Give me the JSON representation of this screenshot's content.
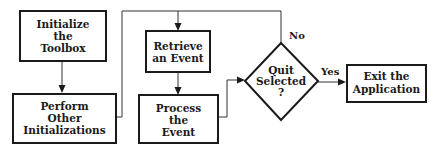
{
  "diagram": {
    "type": "flowchart",
    "nodes": {
      "init_toolbox": {
        "lines": [
          "Initialize",
          "the",
          "Toolbox"
        ],
        "shape": "rectangle"
      },
      "other_inits": {
        "lines": [
          "Perform",
          "Other",
          "Initializations"
        ],
        "shape": "rectangle"
      },
      "retrieve_event": {
        "lines": [
          "Retrieve",
          "an Event"
        ],
        "shape": "rectangle"
      },
      "process_event": {
        "lines": [
          "Process",
          "the",
          "Event"
        ],
        "shape": "rectangle"
      },
      "quit_selected": {
        "lines": [
          "Quit",
          "Selected",
          "?"
        ],
        "shape": "diamond"
      },
      "exit_app": {
        "lines": [
          "Exit the",
          "Application"
        ],
        "shape": "rectangle"
      }
    },
    "edges": {
      "init_to_other": {
        "from": "init_toolbox",
        "to": "other_inits",
        "label": ""
      },
      "other_to_retrieve": {
        "from": "other_inits",
        "to": "retrieve_event",
        "label": ""
      },
      "retrieve_to_process": {
        "from": "retrieve_event",
        "to": "process_event",
        "label": ""
      },
      "process_to_quit": {
        "from": "process_event",
        "to": "quit_selected",
        "label": ""
      },
      "quit_no": {
        "from": "quit_selected",
        "to": "retrieve_event",
        "label": "No"
      },
      "quit_yes": {
        "from": "quit_selected",
        "to": "exit_app",
        "label": "Yes"
      }
    }
  }
}
